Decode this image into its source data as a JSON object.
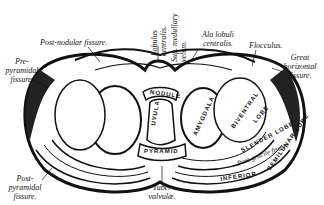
{
  "figure": {
    "type": "anatomical illustration",
    "labels": {
      "post_nodular_fissure": "Post-nodular fissure.",
      "pre_pyramidal_fissure_1": "Pre-",
      "pre_pyramidal_fissure_2": "pyramidal",
      "pre_pyramidal_fissure_3": "fissure.",
      "lobulus_centralis_1": "Lobulus",
      "lobulus_centralis_2": "centralis.",
      "sup_medullary_velum_1": "Sup. medullary",
      "sup_medullary_velum_2": "velum.",
      "ala_lobuli_centralis_1": "Ala lobuli",
      "ala_lobuli_centralis_2": "centralis.",
      "flocculus": "Flocculus.",
      "great_horizontal_fissure_1": "Great",
      "great_horizontal_fissure_2": "horizontal",
      "great_horizontal_fissure_3": "fissure.",
      "post_pyramidal_fissure_1": "Post-",
      "post_pyramidal_fissure_2": "pyramidal",
      "post_pyramidal_fissure_3": "fissure.",
      "tuber_valvulae_1": "Tuber",
      "tuber_valvulae_2": "valvulæ."
    },
    "structures": {
      "nodule": "NODULE",
      "uvula": "UVULA",
      "pyramid": "PYRAMID",
      "amygdala": "AMYGDALA",
      "biventral": "BIVENTRAL",
      "lobe_biventral": "LOBE",
      "slender_lobe": "SLENDER LOBE",
      "post_gracile_fissure": "Post-gracile fissure",
      "inferior": "INFERIOR",
      "semilunar_lobe": "SEMILUNAR LOBE"
    }
  }
}
